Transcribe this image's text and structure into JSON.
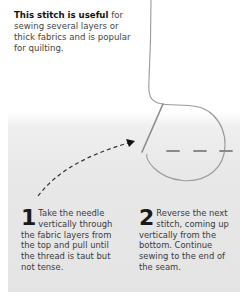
{
  "intro": {
    "bold": "This stitch is useful",
    "rest": " for sewing several layers or thick fabrics and is popular for quilting."
  },
  "illustration": {
    "icons": [
      "thread-icon",
      "needle-icon",
      "dashed-arrow-icon",
      "stitch-dashes-icon"
    ],
    "colors": {
      "fabric": "#e6e6e6",
      "thread": "#9a9a9a",
      "needle": "#8a8a8a",
      "arrow": "#222222"
    }
  },
  "steps": [
    {
      "number": "1",
      "text": "Take the needle vertically through the fabric layers from the top and pull until the thread is taut but not tense."
    },
    {
      "number": "2",
      "text": "Reverse the next stitch, coming up vertically from the bottom. Continue sewing to the end of the seam."
    }
  ]
}
